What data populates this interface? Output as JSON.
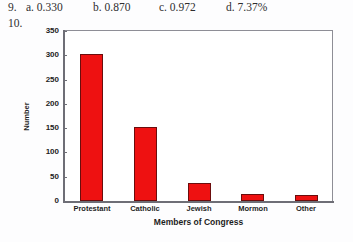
{
  "answer_key": {
    "question_number": "9.",
    "options": [
      {
        "label": "a. 0.330"
      },
      {
        "label": "b. 0.870"
      },
      {
        "label": "c. 0.972"
      },
      {
        "label": "d. 7.37%"
      }
    ],
    "next_question_number": "10."
  },
  "chart_data": {
    "type": "bar",
    "title": "",
    "categories": [
      "Protestant",
      "Catholic",
      "Jewish",
      "Mormon",
      "Other"
    ],
    "values": [
      302,
      152,
      38,
      14,
      12
    ],
    "xlabel": "Members of Congress",
    "ylabel": "Number",
    "ylim": [
      0,
      350
    ],
    "yticks": [
      0,
      50,
      100,
      150,
      200,
      250,
      300,
      350
    ],
    "ytick_labels": [
      "0",
      "50",
      "100",
      "150",
      "200",
      "250",
      "300",
      "350"
    ],
    "grid": false,
    "legend": false,
    "bar_color": "#ee1111",
    "bar_edge_color": "#6b0d0d",
    "plot_background": "#ffffff",
    "axis_color": "#6e6e76"
  }
}
